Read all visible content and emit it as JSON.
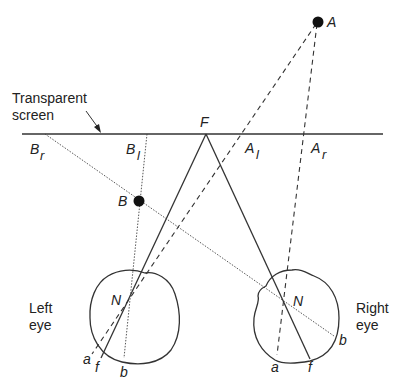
{
  "diagram": {
    "screen_label_line1": "Transparent",
    "screen_label_line2": "screen",
    "fixation_point": "F",
    "point_A": "A",
    "point_B": "B",
    "proj_B_right": "B",
    "proj_B_right_sub": "r",
    "proj_B_left": "B",
    "proj_B_left_sub": "l",
    "proj_A_left": "A",
    "proj_A_left_sub": "l",
    "proj_A_right": "A",
    "proj_A_right_sub": "r",
    "left_eye": {
      "label_line1": "Left",
      "label_line2": "eye",
      "nodal_point": "N",
      "retina_a": "a",
      "retina_f": "f",
      "retina_b": "b"
    },
    "right_eye": {
      "label_line1": "Right",
      "label_line2": "eye",
      "nodal_point": "N",
      "retina_a": "a",
      "retina_f": "f",
      "retina_b": "b"
    }
  }
}
